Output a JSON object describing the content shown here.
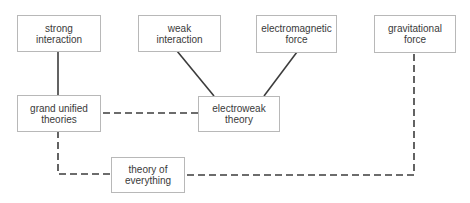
{
  "diagram": {
    "nodes": [
      {
        "id": "strong",
        "label": "strong\ninteraction"
      },
      {
        "id": "weak",
        "label": "weak\ninteraction"
      },
      {
        "id": "em",
        "label": "electromagnetic\nforce"
      },
      {
        "id": "grav",
        "label": "gravitational\nforce"
      },
      {
        "id": "gut",
        "label": "grand unified\ntheories"
      },
      {
        "id": "ew",
        "label": "electroweak\ntheory"
      },
      {
        "id": "toe",
        "label": "theory of\neverything"
      }
    ],
    "edges": [
      {
        "from": "strong",
        "to": "gut",
        "style": "solid"
      },
      {
        "from": "weak",
        "to": "ew",
        "style": "solid"
      },
      {
        "from": "em",
        "to": "ew",
        "style": "solid"
      },
      {
        "from": "gut",
        "to": "ew",
        "style": "dashed"
      },
      {
        "from": "gut",
        "to": "toe",
        "style": "dashed"
      },
      {
        "from": "grav",
        "to": "toe",
        "style": "dashed"
      }
    ],
    "colors": {
      "line": "#3c3c3c",
      "border": "#b8b8b8",
      "text": "#3a3a3a"
    }
  }
}
